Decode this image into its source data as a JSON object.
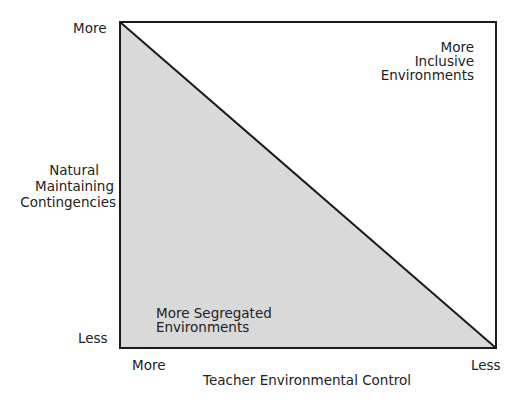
{
  "diagram": {
    "y_axis": {
      "title_lines": [
        "Natural",
        "Maintaining",
        "Contingencies"
      ],
      "top_label": "More",
      "bottom_label": "Less"
    },
    "x_axis": {
      "title": "Teacher Environmental Control",
      "left_label": "More",
      "right_label": "Less"
    },
    "regions": {
      "upper": {
        "lines": [
          "More Inclusive",
          "Environments"
        ],
        "fill": "#ffffff"
      },
      "lower": {
        "lines": [
          "More Segregated",
          "Environments"
        ],
        "fill": "#d9d9d9"
      }
    },
    "colors": {
      "stroke": "#1a1a1a"
    }
  }
}
